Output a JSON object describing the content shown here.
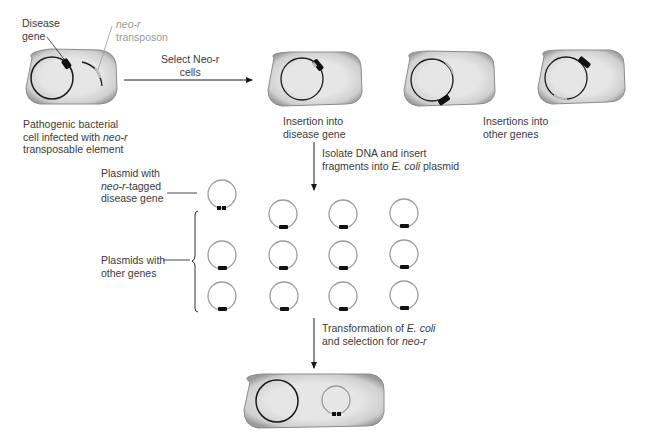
{
  "labels": {
    "disease_gene_l1": "Disease",
    "disease_gene_l2": "gene",
    "transposon_l1": "neo-r",
    "transposon_l2": "transposon",
    "select_l1": "Select Neo-r",
    "select_l2": "cells",
    "pathogenic_l1": "Pathogenic bacterial",
    "pathogenic_l2a": "cell infected with ",
    "pathogenic_l2b": "neo-r",
    "pathogenic_l3": "transposable element",
    "insertion_disease_l1": "Insertion into",
    "insertion_disease_l2": "disease gene",
    "insertions_other_l1": "Insertions into",
    "insertions_other_l2": "other genes",
    "isolate_l1": "Isolate DNA and insert",
    "isolate_l2a": "fragments into ",
    "isolate_l2b": "E. coli",
    "isolate_l2c": " plasmid",
    "plasmid_tagged_l1": "Plasmid with",
    "plasmid_tagged_l2a": "neo-r",
    "plasmid_tagged_l2b": "-tagged",
    "plasmid_tagged_l3": "disease gene",
    "plasmids_other_l1": "Plasmids with",
    "plasmids_other_l2": "other genes",
    "transform_l1a": "Transformation of ",
    "transform_l1b": "E. coli",
    "transform_l2a": "and selection for ",
    "transform_l2b": "neo-r"
  },
  "colors": {
    "cell_fill": "#e4e4e4",
    "cell_edge": "#8c8c8c",
    "chromosome": "#1a1a1a",
    "plasmid": "#9c9c9c",
    "insert": "#111111",
    "transposon_gray": "#a8a8a8"
  },
  "steps": [
    "Pathogenic bacterial cell infected with neo-r transposable element",
    "Select Neo-r cells",
    "Insertion into disease gene / Insertions into other genes",
    "Isolate DNA and insert fragments into E. coli plasmid",
    "Transformation of E. coli and selection for neo-r"
  ],
  "plasmid_grid": {
    "rows": 3,
    "cols": 4,
    "tagged_count": 1,
    "other_count": 11
  }
}
